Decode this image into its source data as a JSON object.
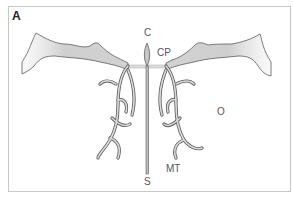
{
  "figure": {
    "panel_label": "A",
    "labels": {
      "C": "C",
      "CP": "CP",
      "O": "O",
      "MT": "MT",
      "S": "S"
    },
    "colors": {
      "bone_fill": "#d0d0d0",
      "bone_stroke": "#5a5a5a",
      "frame": "#c8c8c8",
      "text": "#555555"
    }
  }
}
